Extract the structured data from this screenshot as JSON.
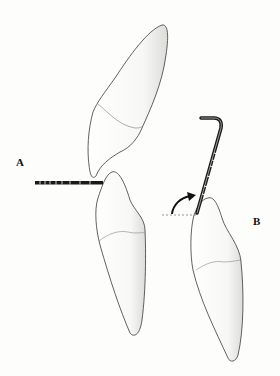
{
  "figure": {
    "labels": {
      "a": "A",
      "b": "B"
    },
    "elements": {
      "upper_tooth": "upper-incisor",
      "lower_tooth_a": "lower-incisor-a",
      "lower_tooth_b": "lower-incisor-b",
      "probe_a": "horizontal-periodontal-probe",
      "probe_b": "angled-periodontal-probe",
      "arrow": "rotation-arrow",
      "reference_line": "dashed-horizontal-reference"
    },
    "colors": {
      "outline": "#3a3a3a",
      "probe": "#1a1a1a",
      "background": "#fdfdfb"
    }
  }
}
